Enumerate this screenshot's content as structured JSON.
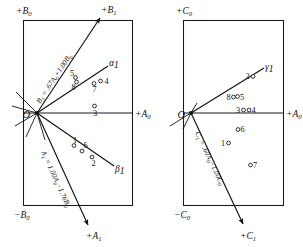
{
  "figure": {
    "type": "oblique-factor-rotation-diagram",
    "panels": [
      {
        "id": "left",
        "name": "panel-ab",
        "origin_label": "O",
        "axis_labels": {
          "top": "+B",
          "top_sub": "0",
          "right": "+A",
          "right_sub": "0",
          "bottom_left": "−B",
          "bottom_left_sub": "0",
          "arrow_top_right": "+B",
          "arrow_top_right_sub": "1",
          "arrow_bottom": "+A",
          "arrow_bottom_sub": "1"
        },
        "ray_labels": [
          {
            "name": "alpha-1",
            "text": "α",
            "sub": "1"
          },
          {
            "name": "beta-1",
            "text": "β",
            "sub": "1"
          }
        ],
        "equations": [
          {
            "name": "equation-b1",
            "text": "B",
            "sub": "1",
            "rest": " = .67A",
            "rest_sub": "0",
            "tail": "+1.00B",
            "tail_sub": "0"
          },
          {
            "name": "equation-a1",
            "text": "A",
            "sub": "1",
            "rest": " = 1.00A",
            "rest_sub": "0",
            "tail": "−1.76B",
            "tail_sub": "0"
          }
        ],
        "points": [
          {
            "id": "5",
            "label": "5",
            "x": 75.5,
            "y": 77.5,
            "label_dx": -5.5,
            "label_dy": -2.0
          },
          {
            "id": "8",
            "label": "8",
            "x": 76.5,
            "y": 82.0,
            "label_dx": -5.0,
            "label_dy": 8.0
          },
          {
            "id": "7",
            "label": "7",
            "x": 94.0,
            "y": 83.5,
            "label_dx": -1.5,
            "label_dy": 8.5
          },
          {
            "id": "4",
            "label": "4",
            "x": 100.5,
            "y": 81.0,
            "label_dx": 4.0,
            "label_dy": 2.5
          },
          {
            "id": "3",
            "label": "3",
            "x": 94.5,
            "y": 106.0,
            "label_dx": -1.5,
            "label_dy": 9.5
          },
          {
            "id": "1",
            "label": "1",
            "x": 74.0,
            "y": 145.5,
            "label_dx": -1.0,
            "label_dy": -3.0
          },
          {
            "id": "6",
            "label": "6",
            "x": 82.0,
            "y": 151.0,
            "label_dx": 1.5,
            "label_dy": -3.5
          },
          {
            "id": "2",
            "label": "2",
            "x": 92.0,
            "y": 157.0,
            "label_dx": -0.5,
            "label_dy": 9.0
          }
        ]
      },
      {
        "id": "right",
        "name": "panel-ac",
        "origin_label": "O",
        "axis_labels": {
          "top": "+C",
          "top_sub": "0",
          "right": "+A",
          "right_sub": "0",
          "bottom_left": "−C",
          "bottom_left_sub": "0",
          "arrow_bottom": "+C",
          "arrow_bottom_sub": "1"
        },
        "ray_labels": [
          {
            "name": "gamma-1",
            "text": "γ",
            "sub": "1"
          }
        ],
        "equations": [
          {
            "name": "equation-c1",
            "text": "C",
            "sub": "1",
            "rest": " = .60A",
            "rest_sub": "0",
            "tail": "−1.00C",
            "tail_sub": "0"
          }
        ],
        "points": [
          {
            "id": "2",
            "label": "2",
            "x": 253.0,
            "y": 76.5,
            "label_dx": -6.0,
            "label_dy": 1.0
          },
          {
            "id": "8",
            "label": "8",
            "x": 233.5,
            "y": 97.0,
            "label_dx": -5.5,
            "label_dy": 1.5
          },
          {
            "id": "5",
            "label": "5",
            "x": 237.5,
            "y": 96.5,
            "label_dx": 3.0,
            "label_dy": 2.0
          },
          {
            "id": "3",
            "label": "3",
            "x": 243.5,
            "y": 110.0,
            "label_dx": -6.0,
            "label_dy": 2.0
          },
          {
            "id": "4",
            "label": "4",
            "x": 249.0,
            "y": 110.0,
            "label_dx": 3.5,
            "label_dy": 2.0
          },
          {
            "id": "6",
            "label": "6",
            "x": 238.0,
            "y": 129.5,
            "label_dx": 3.5,
            "label_dy": 2.0
          },
          {
            "id": "1",
            "label": "1",
            "x": 228.5,
            "y": 143.0,
            "label_dx": -6.5,
            "label_dy": 1.5
          },
          {
            "id": "7",
            "label": "7",
            "x": 250.5,
            "y": 165.0,
            "label_dx": 3.5,
            "label_dy": 2.0
          }
        ]
      }
    ]
  }
}
